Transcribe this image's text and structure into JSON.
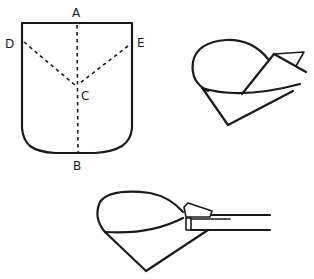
{
  "figures": {
    "pattern": {
      "labels": {
        "a": "A",
        "b": "B",
        "c": "C",
        "d": "D",
        "e": "E"
      }
    },
    "folded_cone": {},
    "cone_with_handle": {}
  },
  "colors": {
    "ink": "#1a1a1a",
    "paper": "#ffffff"
  }
}
